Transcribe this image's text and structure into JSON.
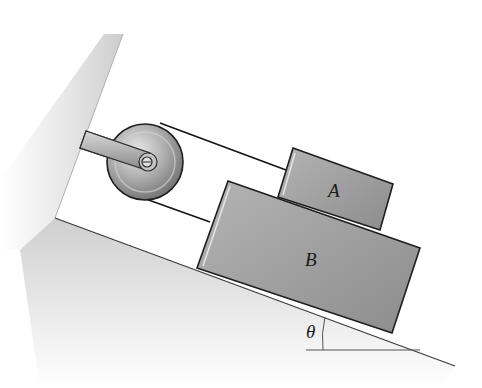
{
  "diagram": {
    "type": "physics-incline-pulley",
    "labels": {
      "block_a": "A",
      "block_b": "B",
      "angle": "θ"
    },
    "colors": {
      "background": "#ffffff",
      "surface_shade": "#d4d4d4",
      "block_fill": "#9e9e9e",
      "block_edge": "#1e1e1e",
      "pulley_fill": "#a8a8a8",
      "rope": "#141414"
    },
    "components": [
      "wall",
      "incline",
      "pulley",
      "pulley-arm",
      "rope-upper",
      "rope-lower",
      "block-a",
      "block-b",
      "angle-marker"
    ]
  }
}
